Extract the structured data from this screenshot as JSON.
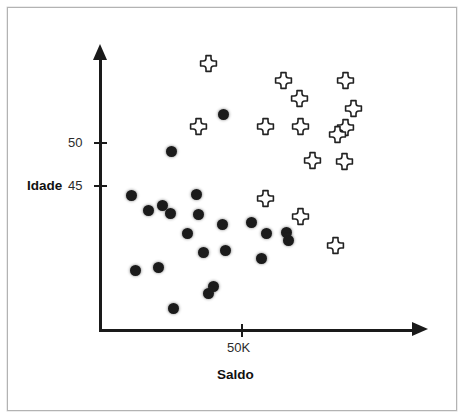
{
  "figure": {
    "background_color": "#ffffff",
    "frame_color": "#b3b3b3",
    "axis_color": "#1a1a1a"
  },
  "axes": {
    "y": {
      "title": "Idade",
      "ticks": [
        {
          "label": "50",
          "value": 50
        },
        {
          "label": "45",
          "value": 45
        }
      ]
    },
    "x": {
      "title": "Saldo",
      "ticks": [
        {
          "label": "50K",
          "value": 50000
        }
      ]
    }
  },
  "chart_data": {
    "type": "scatter",
    "title": "",
    "xlabel": "Saldo",
    "ylabel": "Idade",
    "xlim": [
      0,
      100000
    ],
    "ylim": [
      38,
      57
    ],
    "grid": false,
    "legend": "none",
    "series": [
      {
        "name": "grupo-circulo",
        "marker": "filled-circle",
        "color": "#1b1b1b",
        "points": [
          {
            "x": 22000,
            "y": 44.7,
            "px": 131,
            "py": 195
          },
          {
            "x": 36000,
            "y": 52.0,
            "px": 223,
            "py": 114
          },
          {
            "x": 30000,
            "y": 49.2,
            "px": 171,
            "py": 151
          },
          {
            "x": 29000,
            "y": 44.8,
            "px": 162,
            "py": 205
          },
          {
            "x": 32000,
            "y": 44.0,
            "px": 170,
            "py": 213
          },
          {
            "x": 35000,
            "y": 43.1,
            "px": 196,
            "py": 194
          },
          {
            "x": 34000,
            "y": 42.0,
            "px": 187,
            "py": 233
          },
          {
            "x": 38000,
            "y": 41.0,
            "px": 203,
            "py": 252
          },
          {
            "x": 23000,
            "y": 40.0,
            "px": 135,
            "py": 270
          },
          {
            "x": 33000,
            "y": 38.2,
            "px": 173,
            "py": 308
          },
          {
            "x": 43000,
            "y": 42.6,
            "px": 222,
            "py": 224
          },
          {
            "x": 47000,
            "y": 42.8,
            "px": 251,
            "py": 222
          },
          {
            "x": 51000,
            "y": 42.0,
            "px": 266,
            "py": 233
          },
          {
            "x": 54000,
            "y": 42.1,
            "px": 286,
            "py": 232
          },
          {
            "x": 49000,
            "y": 40.6,
            "px": 261,
            "py": 258
          },
          {
            "x": 41000,
            "y": 39.3,
            "px": 213,
            "py": 286
          },
          {
            "x": 57000,
            "y": 41.6,
            "px": 288,
            "py": 240
          },
          {
            "x": 44000,
            "y": 40.9,
            "px": 225,
            "py": 250
          },
          {
            "x": 26000,
            "y": 43.4,
            "px": 148,
            "py": 210
          },
          {
            "x": 37000,
            "y": 43.3,
            "px": 198,
            "py": 214
          },
          {
            "x": 28000,
            "y": 40.2,
            "px": 158,
            "py": 267
          },
          {
            "x": 40000,
            "y": 38.8,
            "px": 208,
            "py": 293
          }
        ]
      },
      {
        "name": "grupo-cruz",
        "marker": "hollow-cross",
        "color": "#ffffff",
        "outline": "#222222",
        "points": [
          {
            "x": 40000,
            "y": 55.6,
            "px": 208,
            "py": 63
          },
          {
            "x": 58000,
            "y": 54.4,
            "px": 283,
            "py": 80
          },
          {
            "x": 73000,
            "y": 54.4,
            "px": 345,
            "py": 80
          },
          {
            "x": 62000,
            "y": 52.3,
            "px": 299,
            "py": 98
          },
          {
            "x": 75000,
            "y": 51.1,
            "px": 353,
            "py": 108
          },
          {
            "x": 37000,
            "y": 49.0,
            "px": 198,
            "py": 126
          },
          {
            "x": 53000,
            "y": 49.0,
            "px": 265,
            "py": 126
          },
          {
            "x": 62000,
            "y": 49.0,
            "px": 300,
            "py": 126
          },
          {
            "x": 73000,
            "y": 48.9,
            "px": 345,
            "py": 127
          },
          {
            "x": 71000,
            "y": 47.8,
            "px": 337,
            "py": 134
          },
          {
            "x": 65000,
            "y": 46.7,
            "px": 312,
            "py": 160
          },
          {
            "x": 73000,
            "y": 46.6,
            "px": 344,
            "py": 161
          },
          {
            "x": 53000,
            "y": 43.4,
            "px": 265,
            "py": 198
          },
          {
            "x": 60000,
            "y": 41.8,
            "px": 300,
            "py": 216
          },
          {
            "x": 71000,
            "y": 40.2,
            "px": 335,
            "py": 245
          }
        ]
      }
    ]
  }
}
